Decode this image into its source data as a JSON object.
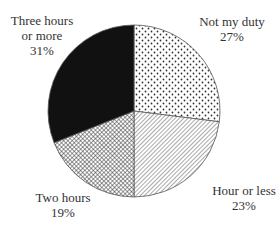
{
  "chart_data": {
    "type": "pie",
    "title": "",
    "start_angle_deg": 0,
    "direction": "clockwise",
    "categories": [
      "Not my duty",
      "Hour or less",
      "Two hours",
      "Three hours or more"
    ],
    "values": [
      27,
      23,
      19,
      31
    ],
    "unit": "%",
    "slices": [
      {
        "label": "Not my duty",
        "value": 27,
        "value_label": "27%",
        "pattern": "dots"
      },
      {
        "label": "Hour or less",
        "value": 23,
        "value_label": "23%",
        "pattern": "diagonal-hatch"
      },
      {
        "label": "Two hours",
        "value": 19,
        "value_label": "19%",
        "pattern": "crosshatch"
      },
      {
        "label": "Three hours or more",
        "value": 31,
        "value_label": "31%",
        "pattern": "solid-black"
      }
    ],
    "legend": "none (direct labels)"
  },
  "labels": {
    "three_hours": {
      "line1": "Three hours",
      "line2": "or more",
      "pct": "31%"
    },
    "not_my_duty": {
      "line1": "Not my duty",
      "pct": "27%"
    },
    "hour_or_less": {
      "line1": "Hour or less",
      "pct": "23%"
    },
    "two_hours": {
      "line1": "Two hours",
      "pct": "19%"
    }
  },
  "colors": {
    "outline": "#555555",
    "solid": "#111111",
    "pattern_ink": "#333333",
    "background": "#ffffff",
    "text": "#333333"
  }
}
